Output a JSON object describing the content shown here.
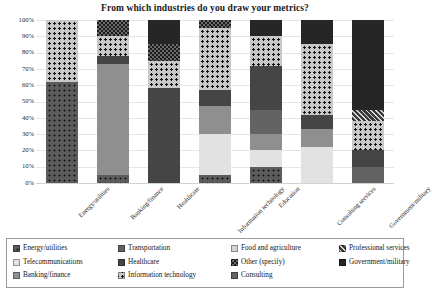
{
  "chart_data": {
    "type": "bar",
    "subtype": "stacked-100-percent",
    "title": "From which industries do you draw your metrics?",
    "xlabel": "",
    "ylabel": "",
    "ylim": [
      0,
      100
    ],
    "grid": true,
    "legend_position": "bottom",
    "ytick_labels": [
      "100%",
      "90%",
      "80%",
      "70%",
      "60%",
      "50%",
      "40%",
      "30%",
      "20%",
      "10%",
      "0%"
    ],
    "ytick_values": [
      100,
      90,
      80,
      70,
      60,
      50,
      40,
      30,
      20,
      10,
      0
    ],
    "categories": [
      "Energy/utilities",
      "Banking/finance",
      "Healthcare",
      "Information technology",
      "Education",
      "Consulting services",
      "Government/military"
    ],
    "series": [
      {
        "name": "Energy/utilities",
        "fill": "f-dark-dot",
        "values": [
          62,
          5,
          0,
          5,
          10,
          0,
          0
        ]
      },
      {
        "name": "Telecommunications",
        "fill": "f-solid-vlight",
        "values": [
          0,
          0,
          0,
          25,
          10,
          22,
          0
        ]
      },
      {
        "name": "Banking/finance",
        "fill": "f-solid-mid",
        "values": [
          0,
          68,
          0,
          17,
          10,
          11,
          0
        ]
      },
      {
        "name": "Transportation",
        "fill": "f-solid-middark",
        "values": [
          0,
          0,
          0,
          0,
          15,
          0,
          10
        ]
      },
      {
        "name": "Healthcare",
        "fill": "f-solid-dark",
        "values": [
          0,
          5,
          58,
          10,
          27,
          9,
          10
        ]
      },
      {
        "name": "Information technology",
        "fill": "f-light-dot",
        "values": [
          38,
          12,
          17,
          38,
          18,
          43,
          18
        ]
      },
      {
        "name": "Food and agriculture",
        "fill": "f-solid-light",
        "values": [
          0,
          0,
          0,
          0,
          0,
          0,
          0
        ]
      },
      {
        "name": "Other (specify)",
        "fill": "f-checker",
        "values": [
          0,
          10,
          10,
          5,
          0,
          0,
          0
        ]
      },
      {
        "name": "Consulting",
        "fill": "f-solid-middark",
        "values": [
          0,
          0,
          0,
          0,
          0,
          0,
          0
        ]
      },
      {
        "name": "Professional services",
        "fill": "f-hatch",
        "values": [
          0,
          0,
          0,
          0,
          0,
          0,
          7
        ]
      },
      {
        "name": "Government/military",
        "fill": "f-solid-verydark",
        "values": [
          0,
          0,
          15,
          0,
          10,
          15,
          55
        ]
      }
    ]
  },
  "legend": {
    "entries": [
      {
        "label": "Energy/utilities",
        "fill": "f-dark-dot"
      },
      {
        "label": "Telecommunications",
        "fill": "f-solid-vlight"
      },
      {
        "label": "Banking/finance",
        "fill": "f-solid-mid"
      },
      {
        "label": "Transportation",
        "fill": "f-solid-middark"
      },
      {
        "label": "Healthcare",
        "fill": "f-solid-dark"
      },
      {
        "label": "Information technology",
        "fill": "f-light-dot"
      },
      {
        "label": "Food and agriculture",
        "fill": "f-solid-light"
      },
      {
        "label": "Other (specify)",
        "fill": "f-checker"
      },
      {
        "label": "Consulting",
        "fill": "f-solid-middark"
      },
      {
        "label": "Professional services",
        "fill": "f-hatch"
      },
      {
        "label": "Government/military",
        "fill": "f-solid-verydark"
      }
    ]
  }
}
